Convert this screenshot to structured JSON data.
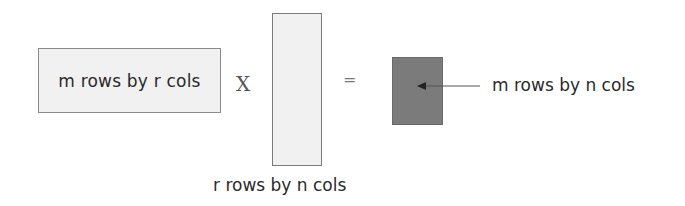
{
  "diagram": {
    "matrix_a": {
      "label": "m rows by r cols",
      "fill": "#f1f1f1"
    },
    "operator_multiply": "X",
    "matrix_b": {
      "label": "r rows by n cols",
      "fill": "#f1f1f1"
    },
    "operator_equals": "=",
    "matrix_c": {
      "label": "m rows by n cols",
      "fill": "#7b7b7b"
    },
    "arrow": {
      "from": "matrix_c_label",
      "to": "matrix_c",
      "color": "#444444"
    }
  }
}
